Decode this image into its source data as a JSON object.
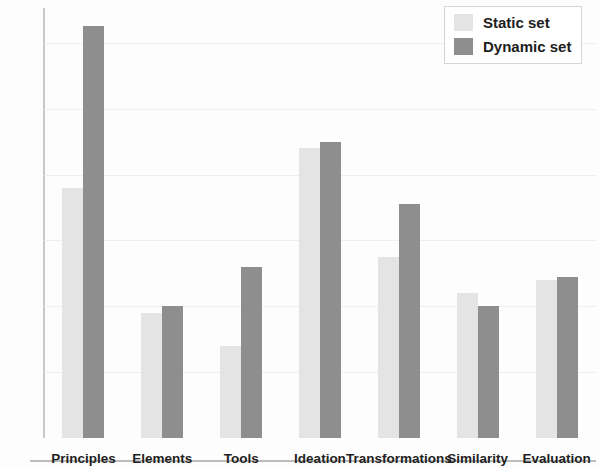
{
  "chart_data": {
    "type": "bar",
    "title": "",
    "subtitle": "",
    "xlabel": "",
    "ylabel": "",
    "ylim": [
      0,
      130
    ],
    "yticks": [
      0,
      20,
      40,
      60,
      80,
      100,
      120
    ],
    "ytick_labels": [
      "0",
      "20",
      "40",
      "60",
      "80",
      "100",
      "120"
    ],
    "grid": true,
    "legend_position": "top-right",
    "categories": [
      "Principles",
      "Elements",
      "Tools",
      "Ideation",
      "Transformations",
      "Similarity",
      "Evaluation"
    ],
    "series": [
      {
        "name": "Static set",
        "color": "#e4e4e4",
        "values": [
          76,
          38,
          28,
          88,
          55,
          44,
          48
        ]
      },
      {
        "name": "Dynamic set",
        "color": "#8e8e8e",
        "values": [
          125,
          40,
          52,
          90,
          71,
          40,
          49
        ]
      }
    ]
  },
  "legend": {
    "items": [
      {
        "label": "Static set",
        "color": "#e4e4e4"
      },
      {
        "label": "Dynamic set",
        "color": "#8e8e8e"
      }
    ]
  },
  "colors": {
    "static_set": "#e4e4e4",
    "dynamic_set": "#8e8e8e",
    "axis": "#bdbdbd",
    "grid": "#efefef",
    "text": "#1f1f1f"
  }
}
